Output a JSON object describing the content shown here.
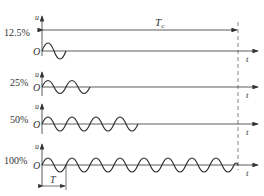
{
  "diagram": {
    "title_symbol": "T",
    "title_subscript": "c",
    "axis_y_label": "u",
    "axis_x_label": "t",
    "origin_label": "O",
    "period_label": "T",
    "rows": [
      {
        "label": "12.5%",
        "cycles": 1
      },
      {
        "label": "25%",
        "cycles": 2
      },
      {
        "label": "50%",
        "cycles": 4
      },
      {
        "label": "100%",
        "cycles": 8
      }
    ],
    "colors": {
      "line": "#333333",
      "dashed": "#666666"
    }
  }
}
